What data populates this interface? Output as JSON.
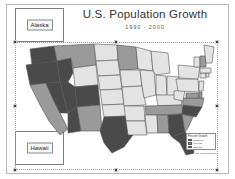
{
  "document": {
    "title": "U.S. Population Growth",
    "subtitle": "1990 - 2000"
  },
  "insets": [
    {
      "name": "alaska",
      "label": "Alaska"
    },
    {
      "name": "hawaii",
      "label": "Hawaii"
    }
  ],
  "legend": {
    "title": "Percent Growth",
    "items": [
      {
        "label": "Under 10",
        "color": "#e3e3e3"
      },
      {
        "label": "10 to 20",
        "color": "#9a9a9a"
      },
      {
        "label": "Over 20",
        "color": "#4a4a4a"
      }
    ]
  },
  "source_note": "Source: U.S. Census Bureau",
  "selection": {
    "handle_count": 8
  },
  "palette": {
    "low": "#e3e3e3",
    "medium": "#9a9a9a",
    "high": "#4a4a4a",
    "outline": "#555555",
    "page_background": "#ffffff",
    "frame": "#b9b9b9"
  },
  "chart_data": {
    "type": "map",
    "title": "U.S. Population Growth",
    "subtitle": "1990 - 2000",
    "categories": [
      "Under 10",
      "10 to 20",
      "Over 20"
    ],
    "regions": [
      {
        "state": "Washington",
        "class": "high"
      },
      {
        "state": "Oregon",
        "class": "high"
      },
      {
        "state": "California",
        "class": "medium"
      },
      {
        "state": "Nevada",
        "class": "high"
      },
      {
        "state": "Idaho",
        "class": "high"
      },
      {
        "state": "Montana",
        "class": "medium"
      },
      {
        "state": "Wyoming",
        "class": "low"
      },
      {
        "state": "Utah",
        "class": "high"
      },
      {
        "state": "Arizona",
        "class": "high"
      },
      {
        "state": "Colorado",
        "class": "high"
      },
      {
        "state": "New Mexico",
        "class": "medium"
      },
      {
        "state": "North Dakota",
        "class": "low"
      },
      {
        "state": "South Dakota",
        "class": "low"
      },
      {
        "state": "Nebraska",
        "class": "low"
      },
      {
        "state": "Kansas",
        "class": "low"
      },
      {
        "state": "Oklahoma",
        "class": "low"
      },
      {
        "state": "Texas",
        "class": "high"
      },
      {
        "state": "Minnesota",
        "class": "medium"
      },
      {
        "state": "Iowa",
        "class": "low"
      },
      {
        "state": "Missouri",
        "class": "low"
      },
      {
        "state": "Arkansas",
        "class": "low"
      },
      {
        "state": "Louisiana",
        "class": "low"
      },
      {
        "state": "Wisconsin",
        "class": "low"
      },
      {
        "state": "Illinois",
        "class": "low"
      },
      {
        "state": "Michigan",
        "class": "low"
      },
      {
        "state": "Indiana",
        "class": "low"
      },
      {
        "state": "Ohio",
        "class": "low"
      },
      {
        "state": "Kentucky",
        "class": "low"
      },
      {
        "state": "Tennessee",
        "class": "medium"
      },
      {
        "state": "Mississippi",
        "class": "low"
      },
      {
        "state": "Alabama",
        "class": "medium"
      },
      {
        "state": "Georgia",
        "class": "high"
      },
      {
        "state": "Florida",
        "class": "high"
      },
      {
        "state": "South Carolina",
        "class": "medium"
      },
      {
        "state": "North Carolina",
        "class": "high"
      },
      {
        "state": "Virginia",
        "class": "medium"
      },
      {
        "state": "West Virginia",
        "class": "low"
      },
      {
        "state": "Maryland",
        "class": "medium"
      },
      {
        "state": "Delaware",
        "class": "medium"
      },
      {
        "state": "Pennsylvania",
        "class": "low"
      },
      {
        "state": "New York",
        "class": "low"
      },
      {
        "state": "New Jersey",
        "class": "low"
      },
      {
        "state": "Connecticut",
        "class": "low"
      },
      {
        "state": "Rhode Island",
        "class": "low"
      },
      {
        "state": "Massachusetts",
        "class": "low"
      },
      {
        "state": "Vermont",
        "class": "low"
      },
      {
        "state": "New Hampshire",
        "class": "medium"
      },
      {
        "state": "Maine",
        "class": "low"
      },
      {
        "state": "Alaska",
        "class": "low"
      },
      {
        "state": "Hawaii",
        "class": "low"
      }
    ]
  }
}
